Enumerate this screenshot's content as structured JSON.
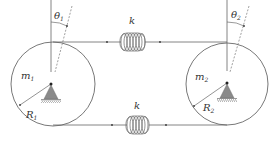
{
  "diagram": {
    "colors": {
      "line": "#555555",
      "support": "#808080",
      "spring": "#666666",
      "text": "#333333",
      "background": "#ffffff"
    },
    "disk_left": {
      "mass_label": "m",
      "mass_sub": "1",
      "radius_label": "R",
      "radius_sub": "1",
      "angle_label": "θ",
      "angle_sub": "1"
    },
    "disk_right": {
      "mass_label": "m",
      "mass_sub": "2",
      "radius_label": "R",
      "radius_sub": "2",
      "angle_label": "θ",
      "angle_sub": "2"
    },
    "spring_top": {
      "label": "k"
    },
    "spring_bottom": {
      "label": "k"
    }
  }
}
